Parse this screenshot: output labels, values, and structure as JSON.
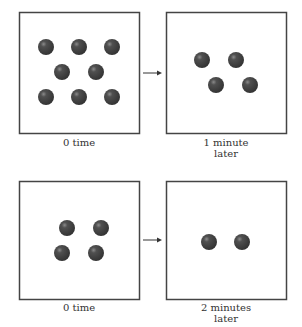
{
  "colors": {
    "frame": "#444444",
    "ball": "#3e3e3e",
    "highlight": "#9a9a9a",
    "arrow": "#333333"
  },
  "panels": [
    {
      "id": "top-left",
      "label_line1": "0 time",
      "label_line2": "",
      "box": [
        19,
        12,
        120,
        121
      ],
      "balls": [
        [
          46,
          47
        ],
        [
          79,
          47
        ],
        [
          112,
          47
        ],
        [
          62,
          72
        ],
        [
          96,
          72
        ],
        [
          46,
          97
        ],
        [
          79,
          97
        ],
        [
          112,
          97
        ]
      ]
    },
    {
      "id": "top-right",
      "label_line1": "1  minute",
      "label_line2": "later",
      "box": [
        166,
        12,
        120,
        121
      ],
      "balls": [
        [
          202,
          60
        ],
        [
          236,
          60
        ],
        [
          216,
          85
        ],
        [
          250,
          85
        ]
      ]
    },
    {
      "id": "bottom-left",
      "label_line1": "0 time",
      "label_line2": "",
      "box": [
        19,
        181,
        120,
        118
      ],
      "balls": [
        [
          67,
          228
        ],
        [
          101,
          228
        ],
        [
          62,
          253
        ],
        [
          96,
          253
        ]
      ]
    },
    {
      "id": "bottom-right",
      "label_line1": "2  minutes",
      "label_line2": "later",
      "box": [
        166,
        181,
        120,
        118
      ],
      "balls": [
        [
          209,
          242
        ],
        [
          242,
          242
        ]
      ]
    }
  ],
  "arrows": [
    {
      "from": [
        143,
        73
      ],
      "to": [
        162,
        73
      ]
    },
    {
      "from": [
        143,
        240
      ],
      "to": [
        162,
        240
      ]
    }
  ],
  "ball_radius": 8
}
